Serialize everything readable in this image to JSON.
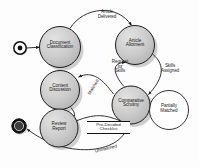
{
  "diagram": {
    "kind": "uml-state-diagram",
    "canvas": {
      "width": 199,
      "height": 167,
      "background": "#fdfdfd"
    },
    "palette": {
      "state_fill": "#c9c9c9",
      "state_fill_light": "#d6d6d6",
      "state_stroke": "#2a2a2a",
      "shadow": "#9a9a9a",
      "plain_fill": "#ffffff",
      "edge_stroke": "#1c1c1c",
      "text": "#1a1a1a"
    },
    "markers": {
      "start": {
        "name": "start-state",
        "label": "",
        "cx": 20,
        "cy": 48,
        "r_outer": 6.2,
        "r_inner": 2.4
      },
      "end": {
        "name": "final-state",
        "label": "",
        "cx": 19,
        "cy": 126,
        "r_outer": 7.2,
        "r_inner": 4.6
      }
    },
    "states": [
      {
        "id": "document-classification",
        "label": "Document\nClassification",
        "cx": 60,
        "cy": 47,
        "r": 20.5,
        "style": "shaded"
      },
      {
        "id": "article-allotment",
        "label": "Article\nAllotment",
        "cx": 135,
        "cy": 45,
        "r": 19.5,
        "style": "shaded"
      },
      {
        "id": "content-discussion",
        "label": "Content\nDiscussion",
        "cx": 60,
        "cy": 90,
        "r": 19.5,
        "style": "shaded"
      },
      {
        "id": "comparative-scrutiny",
        "label": "Comparative\nScrutiny",
        "cx": 131,
        "cy": 105,
        "r": 19.0,
        "style": "shaded"
      },
      {
        "id": "review-report",
        "label": "Review\nReport",
        "cx": 59,
        "cy": 128,
        "r": 19.0,
        "style": "shaded"
      },
      {
        "id": "partially-matched",
        "label": "Partially\nMatched",
        "cx": 169,
        "cy": 110,
        "r": 19.5,
        "style": "plain"
      }
    ],
    "transitions": [
      {
        "id": "t-start",
        "label": "",
        "from": "start-state",
        "to": "document-classification"
      },
      {
        "id": "t-article-delivered",
        "label": "Article\nDelivered",
        "from": "document-classification",
        "to": "article-allotment",
        "lx": 107,
        "ly": 16
      },
      {
        "id": "t-request-for-skills",
        "label": "Request\nfor\nSkills",
        "from": "comparative-scrutiny",
        "to": "article-allotment",
        "lx": 120,
        "ly": 68
      },
      {
        "id": "t-skills-assigned",
        "label": "Skills\nAssigned",
        "from": "article-allotment",
        "to": "comparative-scrutiny",
        "lx": 170,
        "ly": 70
      },
      {
        "id": "t-matched",
        "label": "Matched",
        "from": "comparative-scrutiny",
        "to": "content-discussion",
        "lx": 93,
        "ly": 88
      },
      {
        "id": "t-partially-matched",
        "label": "Partially\nMatched",
        "from": "comparative-scrutiny",
        "to": "partially-matched",
        "lx": 169,
        "ly": 110
      },
      {
        "id": "t-pre-decided",
        "label": "Pre-Decided\nChecklist",
        "from": "review-report",
        "to": "comparative-scrutiny",
        "lx": 107,
        "ly": 127
      },
      {
        "id": "t-unmatched",
        "label": "Unmatched",
        "from": "comparative-scrutiny",
        "to": "final-state",
        "lx": 108,
        "ly": 151
      },
      {
        "id": "t-discussion-review",
        "label": "",
        "from": "content-discussion",
        "to": "review-report"
      }
    ]
  }
}
